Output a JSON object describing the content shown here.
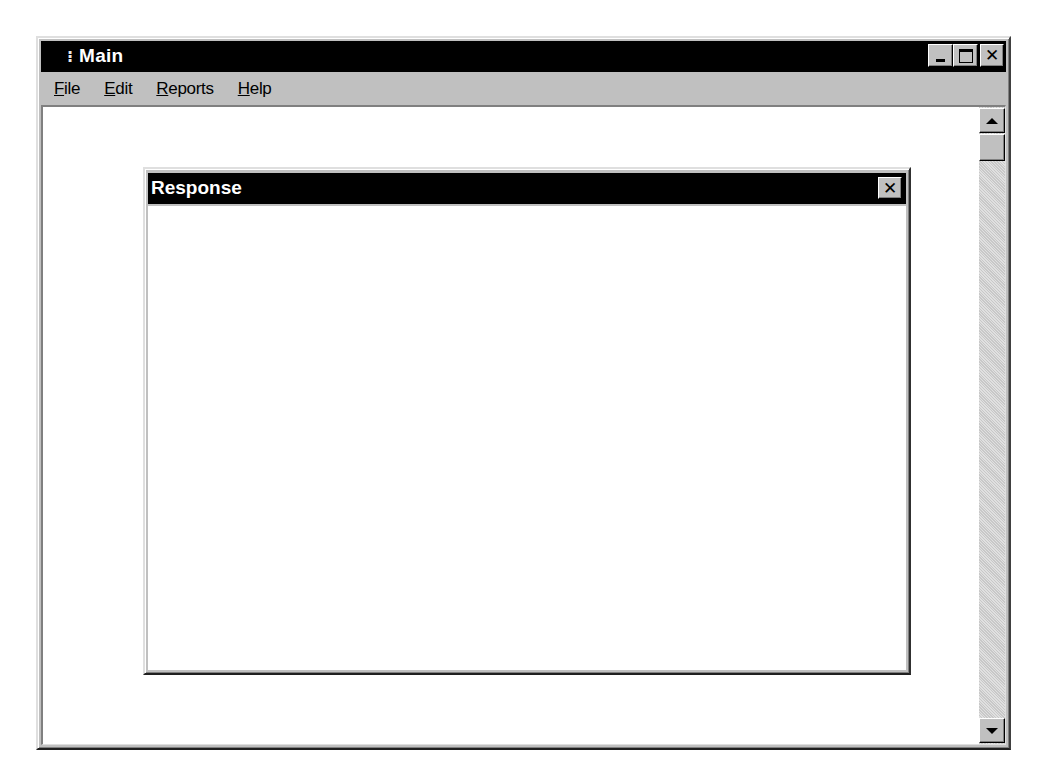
{
  "main_window": {
    "title": "Main",
    "title_icon": "⁝",
    "caption_buttons": {
      "minimize": "minimize",
      "maximize": "maximize",
      "close": "✕"
    },
    "menu": [
      {
        "accel": "F",
        "rest": "ile",
        "label": "File"
      },
      {
        "accel": "E",
        "rest": "dit",
        "label": "Edit"
      },
      {
        "accel": "R",
        "rest": "eports",
        "label": "Reports"
      },
      {
        "accel": "H",
        "rest": "elp",
        "label": "Help"
      }
    ],
    "scrollbar": {
      "orientation": "vertical",
      "up_icon": "arrow-up",
      "down_icon": "arrow-down"
    }
  },
  "response_dialog": {
    "title": "Response",
    "close_glyph": "✕",
    "body_text": ""
  },
  "colors": {
    "title_bar": "#000000",
    "title_text": "#ffffff",
    "chrome": "#c0c0c0",
    "client": "#ffffff"
  }
}
